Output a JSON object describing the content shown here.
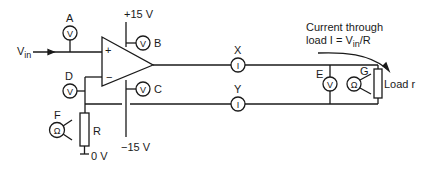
{
  "diagram": {
    "type": "circuit",
    "title": "",
    "input_label": "V",
    "input_subscript": "in",
    "opamp": {
      "plus": "+",
      "minus": "−"
    },
    "supplies": {
      "positive": "+15 V",
      "negative": "−15 V",
      "ground": "0 V"
    },
    "meters": {
      "A": {
        "label": "A",
        "glyph": "V",
        "kind": "voltmeter"
      },
      "B": {
        "label": "B",
        "glyph": "V",
        "kind": "voltmeter"
      },
      "C": {
        "label": "C",
        "glyph": "V",
        "kind": "voltmeter"
      },
      "D": {
        "label": "D",
        "glyph": "V",
        "kind": "voltmeter"
      },
      "E": {
        "label": "E",
        "glyph": "V",
        "kind": "voltmeter"
      },
      "F": {
        "label": "F",
        "glyph": "Ω",
        "kind": "ohmmeter"
      },
      "G": {
        "label": "G",
        "glyph": "Ω",
        "kind": "ohmmeter"
      },
      "X": {
        "label": "X",
        "glyph": "I",
        "kind": "ammeter"
      },
      "Y": {
        "label": "Y",
        "glyph": "I",
        "kind": "ammeter"
      }
    },
    "resistor_R": "R",
    "load": "Load r",
    "annotation": {
      "line1": "Current through",
      "line2_prefix": "load I = V",
      "line2_sub": "in",
      "line2_suffix": "/R"
    }
  },
  "colors": {
    "ink": "#1a1a1a",
    "background": "#ffffff"
  }
}
